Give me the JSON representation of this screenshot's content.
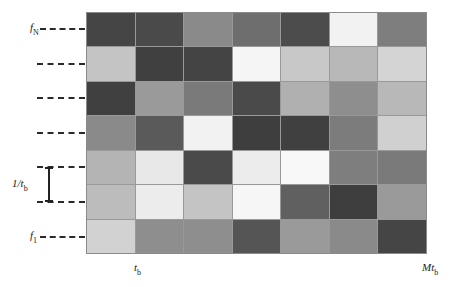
{
  "diagram": {
    "rows": 7,
    "cols": 7,
    "cells": [
      [
        "#454545",
        "#4a4a4a",
        "#8a8a8a",
        "#6e6e6e",
        "#4c4c4c",
        "#f2f2f2",
        "#7e7e7e"
      ],
      [
        "#c4c4c4",
        "#404040",
        "#444444",
        "#f5f5f5",
        "#c8c8c8",
        "#b8b8b8",
        "#d4d4d4"
      ],
      [
        "#404040",
        "#9a9a9a",
        "#7a7a7a",
        "#4a4a4a",
        "#b0b0b0",
        "#8e8e8e",
        "#b8b8b8"
      ],
      [
        "#8a8a8a",
        "#5a5a5a",
        "#f2f2f2",
        "#3e3e3e",
        "#404040",
        "#7c7c7c",
        "#d0d0d0"
      ],
      [
        "#b4b4b4",
        "#e8e8e8",
        "#4a4a4a",
        "#ececec",
        "#f8f8f8",
        "#7e7e7e",
        "#7a7a7a"
      ],
      [
        "#bcbcbc",
        "#ececec",
        "#c4c4c4",
        "#f6f6f6",
        "#606060",
        "#3e3e3e",
        "#9a9a9a"
      ],
      [
        "#d2d2d2",
        "#8e8e8e",
        "#8e8e8e",
        "#555555",
        "#9a9a9a",
        "#8a8a8a",
        "#454545"
      ]
    ]
  },
  "labels": {
    "f_top": {
      "main": "f",
      "sub": "N"
    },
    "f_bottom": {
      "main": "f",
      "sub": "1"
    },
    "bin_width": {
      "main": "1/t",
      "sub": "b"
    },
    "x_start": {
      "main": "t",
      "sub": "b"
    },
    "x_end": {
      "main": "Mt",
      "sub": "b"
    }
  }
}
